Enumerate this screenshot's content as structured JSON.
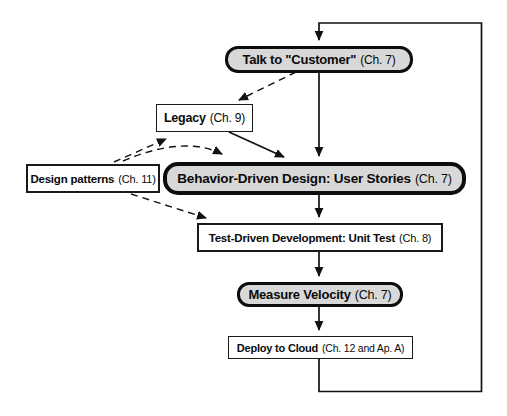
{
  "diagram": {
    "kind": "flowchart",
    "background_color": "#ffffff",
    "line_color": "#111111",
    "emphasis_fill_color": "#d8d8d8",
    "nodes": {
      "talk_customer": {
        "label": "Talk to \"Customer\"",
        "chapter": "(Ch. 7)",
        "shape": "rounded-emphasis"
      },
      "legacy": {
        "label": "Legacy",
        "chapter": "(Ch. 9)",
        "shape": "rectangle"
      },
      "design_patterns": {
        "label": "Design patterns",
        "chapter": "(Ch. 11)",
        "shape": "rectangle"
      },
      "bdd": {
        "label": "Behavior-Driven Design: User Stories",
        "chapter": "(Ch. 7)",
        "shape": "rounded-emphasis"
      },
      "tdd": {
        "label": "Test-Driven Development: Unit Test",
        "chapter": "(Ch. 8)",
        "shape": "rectangle"
      },
      "measure_velocity": {
        "label": "Measure Velocity",
        "chapter": "(Ch. 7)",
        "shape": "rounded-emphasis"
      },
      "deploy_cloud": {
        "label": "Deploy to Cloud",
        "chapter": "(Ch. 12 and Ap. A)",
        "shape": "rectangle"
      }
    },
    "edges": [
      {
        "from": "deploy_cloud",
        "to": "talk_customer",
        "style": "solid",
        "note": "feedback loop around right side"
      },
      {
        "from": "talk_customer",
        "to": "bdd",
        "style": "solid"
      },
      {
        "from": "bdd",
        "to": "tdd",
        "style": "solid"
      },
      {
        "from": "tdd",
        "to": "measure_velocity",
        "style": "solid"
      },
      {
        "from": "measure_velocity",
        "to": "deploy_cloud",
        "style": "solid"
      },
      {
        "from": "legacy",
        "to": "bdd",
        "style": "solid"
      },
      {
        "from": "talk_customer",
        "to": "legacy",
        "style": "dashed"
      },
      {
        "from": "design_patterns",
        "to": "legacy",
        "style": "dashed"
      },
      {
        "from": "design_patterns",
        "to": "bdd",
        "style": "dashed"
      },
      {
        "from": "design_patterns",
        "to": "tdd",
        "style": "dashed"
      }
    ]
  }
}
